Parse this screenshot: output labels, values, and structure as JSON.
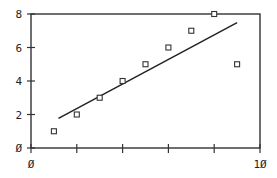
{
  "chart_data": {
    "type": "scatter",
    "title": "",
    "xlabel": "",
    "ylabel": "",
    "xlim": [
      0,
      10
    ],
    "ylim": [
      0,
      8
    ],
    "x_ticks": [
      0,
      2,
      4,
      6,
      8,
      10
    ],
    "x_tick_labels": [
      "Ø",
      "",
      "",
      "",
      "",
      "1Ø"
    ],
    "y_ticks": [
      0,
      2,
      4,
      6,
      8
    ],
    "y_tick_labels": [
      "Ø",
      "2",
      "4",
      "6",
      "8"
    ],
    "grid": false,
    "legend": null,
    "series": [
      {
        "name": "data",
        "marker": "open-square",
        "x": [
          1,
          2,
          3,
          4,
          5,
          6,
          7,
          8,
          9
        ],
        "y": [
          1,
          2,
          3,
          4,
          5,
          6,
          7,
          8,
          5
        ]
      },
      {
        "name": "linear fit",
        "type": "line",
        "slope": 0.733,
        "intercept": 0.889,
        "x": [
          1.2,
          9.0
        ],
        "y": [
          1.77,
          7.49
        ]
      }
    ]
  },
  "colors": {
    "axis": "#333333",
    "marker": "#333333",
    "line": "#222222"
  }
}
